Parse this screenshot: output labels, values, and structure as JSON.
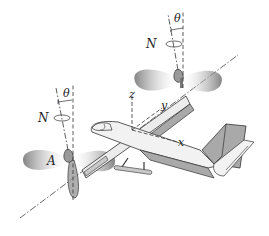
{
  "figure": {
    "colors": {
      "line": "#333333",
      "fill_gray": "#a9a9a9",
      "fill_light": "#ececec",
      "rotor_disc_dark": "#8a8a8a",
      "background": "#ffffff"
    },
    "labels": {
      "theta_left": "θ",
      "theta_right": "θ",
      "N_left": "N",
      "N_right": "N",
      "A": "A",
      "z": "z",
      "y": "y",
      "x": "x"
    }
  }
}
